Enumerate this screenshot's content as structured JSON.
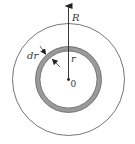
{
  "diagram": {
    "title": "",
    "labels": {
      "outer_radius": "R",
      "shell_radius": "r",
      "shell_thickness": "dr",
      "center": "0"
    },
    "geometry": {
      "center": [
        68.5,
        79.5
      ],
      "outer_circle_radius": 56,
      "shell_outer_radius": 33,
      "shell_inner_radius": 28.5
    },
    "colors": {
      "line": "#555555",
      "shell_fill": "#9a9a9a",
      "background": "#ffffff"
    }
  }
}
